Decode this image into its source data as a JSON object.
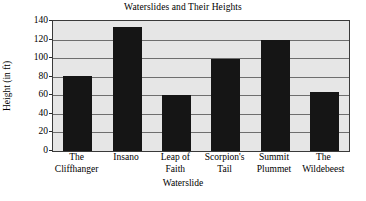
{
  "chart_data": {
    "type": "bar",
    "title": "Waterslides and Their Heights",
    "xlabel": "Waterslide",
    "ylabel": "Height (in ft)",
    "categories": [
      "The\nCliffhanger",
      "Insano",
      "Leap of\nFaith",
      "Scorpion's\nTail",
      "Summit\nPlummet",
      "The\nWildebeest"
    ],
    "values": [
      81,
      134,
      60,
      99,
      120,
      64
    ],
    "ylim": [
      0,
      140
    ],
    "ytick_labels": [
      "0",
      "20",
      "40",
      "60",
      "80",
      "100",
      "120",
      "140"
    ],
    "ytick_values": [
      0,
      20,
      40,
      60,
      80,
      100,
      120,
      140
    ],
    "ytick_step": 20,
    "grid": "horizontal",
    "legend": "none",
    "bar_color": "#151515",
    "plot_background": "#e6e6e6",
    "gridline_color": "#6e6e6e",
    "frame_color": "#3a3a3a"
  }
}
